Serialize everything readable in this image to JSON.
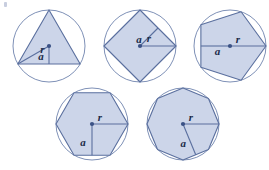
{
  "figure": {
    "title": "Regular polygons inscribed in circles with radius r and apothem a",
    "canvas": {
      "width": 269,
      "height": 170,
      "background": "#ffffff"
    },
    "style": {
      "polygon_fill": "#ccd5e9",
      "polygon_stroke": "#5a6f9e",
      "circle_stroke": "#6f83ae",
      "segment_stroke": "#5a6f9e",
      "center_dot_color": "#3b5286",
      "label_color": "#1b2b4a",
      "polygon_stroke_width": 1.1,
      "circle_stroke_width": 0.9,
      "segment_stroke_width": 1.1,
      "center_dot_radius": 2.1,
      "label_font_size": 11
    },
    "labels": {
      "radius": "r",
      "apothem": "a"
    },
    "shapes": [
      {
        "name": "triangle-in-circle",
        "sides": 3,
        "center": {
          "x": 49,
          "y": 46
        },
        "circle_radius": 36,
        "rotation_deg": -90,
        "radius_segment": {
          "to_vertex_index": 2,
          "label_offset": {
            "x": 9,
            "y": -5
          }
        },
        "apothem_segment": {
          "to_edge_index": 1,
          "label_offset": {
            "x": -8,
            "y": 2
          }
        }
      },
      {
        "name": "square-in-circle",
        "sides": 4,
        "center": {
          "x": 140,
          "y": 46
        },
        "circle_radius": 36,
        "rotation_deg": 0,
        "radius_segment": {
          "to_vertex_index": 0,
          "label_offset": {
            "x": -9,
            "y": -7
          }
        },
        "apothem_segment": {
          "to_edge_index": 3,
          "label_offset": {
            "x": -10,
            "y": 3
          }
        }
      },
      {
        "name": "pentagon-in-circle",
        "sides": 5,
        "center": {
          "x": 230,
          "y": 46
        },
        "circle_radius": 36,
        "rotation_deg": 0,
        "radius_segment": {
          "to_vertex_index": 0,
          "label_offset": {
            "x": -10,
            "y": -6
          }
        },
        "apothem_segment": {
          "to_edge_index": 2,
          "label_offset": {
            "x": 2,
            "y": 6
          }
        }
      },
      {
        "name": "hexagon-in-circle",
        "sides": 6,
        "center": {
          "x": 92,
          "y": 124
        },
        "circle_radius": 36,
        "rotation_deg": 0,
        "radius_segment": {
          "to_vertex_index": 0,
          "label_offset": {
            "x": -10,
            "y": -6
          }
        },
        "apothem_segment": {
          "to_edge_index": 1,
          "label_offset": {
            "x": -9,
            "y": 4
          }
        }
      },
      {
        "name": "octagon-in-circle",
        "sides": 8,
        "center": {
          "x": 183,
          "y": 124
        },
        "circle_radius": 36,
        "rotation_deg": 0,
        "radius_segment": {
          "to_vertex_index": 0,
          "label_offset": {
            "x": -10,
            "y": -6
          }
        },
        "apothem_segment": {
          "to_edge_index": 1,
          "label_offset": {
            "x": -6,
            "y": 5
          }
        }
      }
    ]
  }
}
